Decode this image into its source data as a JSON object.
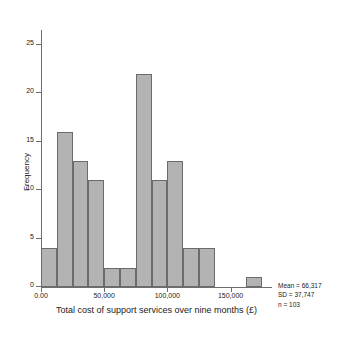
{
  "chart_data": {
    "type": "bar",
    "title": "",
    "subtitle": "",
    "xlabel": "Total cost of support services over nine months (£)",
    "ylabel": "Frequency",
    "xlim": [
      0,
      182000
    ],
    "ylim": [
      0,
      26
    ],
    "grid": false,
    "legend_position": "right-bottom",
    "bin_width": 12500,
    "x_ticks": [
      {
        "value": 0,
        "label": "0.00"
      },
      {
        "value": 50000,
        "label": "50,000"
      },
      {
        "value": 100000,
        "label": "100,000"
      },
      {
        "value": 150000,
        "label": "150,000"
      }
    ],
    "y_ticks": [
      {
        "value": 0,
        "label": "0"
      },
      {
        "value": 5,
        "label": "5"
      },
      {
        "value": 10,
        "label": "10"
      },
      {
        "value": 15,
        "label": "15"
      },
      {
        "value": 20,
        "label": "20"
      },
      {
        "value": 25,
        "label": "25"
      }
    ],
    "bins": [
      {
        "start": 0,
        "end": 12500,
        "value": 4
      },
      {
        "start": 12500,
        "end": 25000,
        "value": 16
      },
      {
        "start": 25000,
        "end": 37500,
        "value": 13
      },
      {
        "start": 37500,
        "end": 50000,
        "value": 11
      },
      {
        "start": 50000,
        "end": 62500,
        "value": 2
      },
      {
        "start": 62500,
        "end": 75000,
        "value": 2
      },
      {
        "start": 75000,
        "end": 87500,
        "value": 22
      },
      {
        "start": 87500,
        "end": 100000,
        "value": 11
      },
      {
        "start": 100000,
        "end": 112500,
        "value": 13
      },
      {
        "start": 112500,
        "end": 125000,
        "value": 4
      },
      {
        "start": 125000,
        "end": 137500,
        "value": 4
      },
      {
        "start": 137500,
        "end": 150000,
        "value": 0
      },
      {
        "start": 150000,
        "end": 162500,
        "value": 0
      },
      {
        "start": 162500,
        "end": 175000,
        "value": 1
      }
    ],
    "categories": [
      "0–12,500",
      "12,500–25,000",
      "25,000–37,500",
      "37,500–50,000",
      "50,000–62,500",
      "62,500–75,000",
      "75,000–87,500",
      "87,500–100,000",
      "100,000–112,500",
      "112,500–125,000",
      "125,000–137,500",
      "137,500–150,000",
      "150,000–162,500",
      "162,500–175,000"
    ],
    "values": [
      4,
      16,
      13,
      11,
      2,
      2,
      22,
      11,
      13,
      4,
      4,
      0,
      0,
      1
    ],
    "annotations": {
      "mean": "Mean = 66,317",
      "sd": "SD = 37,747",
      "n": "n = 103"
    },
    "colors": {
      "bar_fill": "#b3b3b3",
      "bar_stroke": "#6b6b6b",
      "axis": "#6e6e6e",
      "text": "#1a1a1a",
      "background": "#ffffff"
    }
  }
}
